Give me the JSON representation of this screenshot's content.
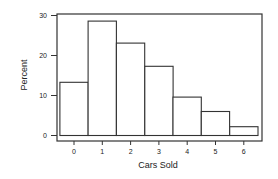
{
  "chart_data": {
    "type": "bar",
    "title": "",
    "xlabel": "Cars Sold",
    "ylabel": "Percent",
    "categories": [
      "0",
      "1",
      "2",
      "3",
      "4",
      "5",
      "6"
    ],
    "values": [
      13.3,
      28.6,
      23.1,
      17.3,
      9.6,
      6.0,
      2.2
    ],
    "ylim": [
      0,
      30
    ],
    "yticks": [
      0,
      10,
      20,
      30
    ],
    "yticks_labels": [
      "0",
      "10",
      "20",
      "30"
    ],
    "grid": false,
    "legend": null,
    "bar_style": "histogram, adjacent bars, white fill, dark outline"
  },
  "colors": {
    "bar_fill": "#ffffff",
    "bar_stroke": "#333333",
    "axis": "#333333"
  }
}
